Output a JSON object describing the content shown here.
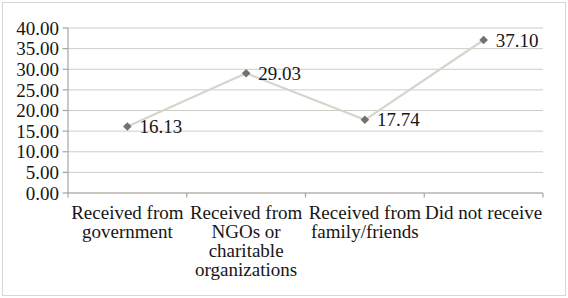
{
  "chart_data": {
    "type": "line",
    "title": "",
    "xlabel": "",
    "ylabel": "",
    "legend": "none",
    "grid": "horizontal",
    "marker_shape": "diamond",
    "categories": [
      "Received from government",
      "Received from NGOs or charitable organizations",
      "Received from family/friends",
      "Did not receive"
    ],
    "category_lines": [
      [
        "Received from",
        "government"
      ],
      [
        "Received from",
        "NGOs or",
        "charitable",
        "organizations"
      ],
      [
        "Received from",
        "family/friends"
      ],
      [
        "Did not receive"
      ]
    ],
    "values": [
      16.13,
      29.03,
      17.74,
      37.1
    ],
    "value_labels": [
      "16.13",
      "29.03",
      "17.74",
      "37.10"
    ],
    "ylim": [
      0,
      40
    ],
    "yticks": [
      0,
      5,
      10,
      15,
      20,
      25,
      30,
      35,
      40
    ],
    "ytick_labels": [
      "0.00",
      "5.00",
      "10.00",
      "15.00",
      "20.00",
      "25.00",
      "30.00",
      "35.00",
      "40.00"
    ],
    "colors": {
      "series_line": "#d8d4cd",
      "marker": "#74726d",
      "gridline": "#cfccc6",
      "axis": "#a9a6a1",
      "text": "#161616",
      "background": "#ffffff",
      "border": "#d9d6d1"
    }
  }
}
